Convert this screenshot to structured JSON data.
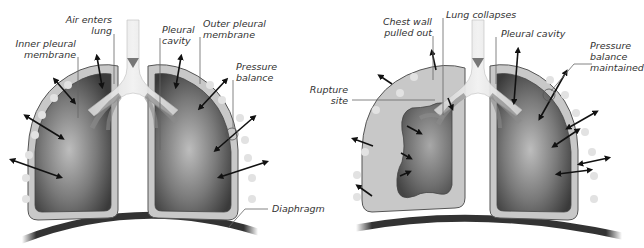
{
  "figure": {
    "panels": [
      {
        "id": "normal",
        "description": "Normal lungs with intact pleura",
        "labels": {
          "inner_pleural_membrane": [
            "Inner pleural",
            "membrane"
          ],
          "air_enters_lung": [
            "Air enters",
            "lung"
          ],
          "pleural_cavity": [
            "Pleural",
            "cavity"
          ],
          "outer_pleural_membrane": [
            "Outer pleural",
            "membrane"
          ],
          "pressure_balance": [
            "Pressure",
            "balance"
          ],
          "diaphragm": "Diaphragm"
        }
      },
      {
        "id": "pneumothorax",
        "description": "Collapsed left lung after pleural rupture",
        "labels": {
          "chest_wall_pulled_out": [
            "Chest wall",
            "pulled out"
          ],
          "lung_collapses": "Lung collapses",
          "pleural_cavity": "Pleural cavity",
          "rupture_site": [
            "Rupture",
            "site"
          ],
          "pressure_balance_maintained": [
            "Pressure",
            "balance",
            "maintained"
          ]
        }
      }
    ],
    "colors": {
      "lung_dark": "#3c3c3c",
      "lung_light": "#b8b8b8",
      "pleura": "#c8c8c8",
      "outline": "#555555",
      "diaphragm": "#333333",
      "arrow": "#111111",
      "bubble": "#e2e2e2"
    }
  }
}
